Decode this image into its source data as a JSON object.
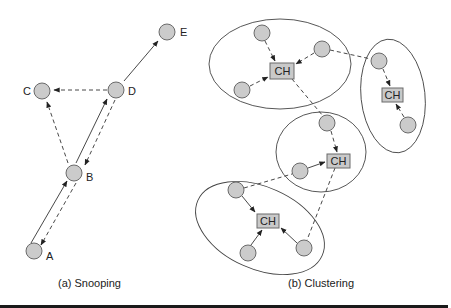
{
  "figure": {
    "snooping": {
      "caption": "(a) Snooping",
      "nodes": [
        {
          "id": "A",
          "label": "A"
        },
        {
          "id": "B",
          "label": "B"
        },
        {
          "id": "C",
          "label": "C"
        },
        {
          "id": "D",
          "label": "D"
        },
        {
          "id": "E",
          "label": "E"
        }
      ],
      "edges": [
        {
          "from": "A",
          "to": "B",
          "style": "solid"
        },
        {
          "from": "B",
          "to": "A",
          "style": "dashed"
        },
        {
          "from": "B",
          "to": "D",
          "style": "solid"
        },
        {
          "from": "D",
          "to": "B",
          "style": "dashed"
        },
        {
          "from": "B",
          "to": "C",
          "style": "dashed"
        },
        {
          "from": "D",
          "to": "C",
          "style": "dashed"
        },
        {
          "from": "D",
          "to": "E",
          "style": "solid"
        }
      ]
    },
    "clustering": {
      "caption": "(b) Clustering",
      "cluster_head_label": "CH",
      "clusters": [
        {
          "name": "top-left",
          "head": "CH",
          "members": 3
        },
        {
          "name": "right",
          "head": "CH",
          "members": 2
        },
        {
          "name": "middle",
          "head": "CH",
          "members": 2
        },
        {
          "name": "bottom",
          "head": "CH",
          "members": 3
        }
      ]
    }
  },
  "colors": {
    "node_fill": "#cbcbcb",
    "node_stroke": "#6a6a6a",
    "line": "#333333",
    "bottom_bar": "#1a1a1a"
  }
}
